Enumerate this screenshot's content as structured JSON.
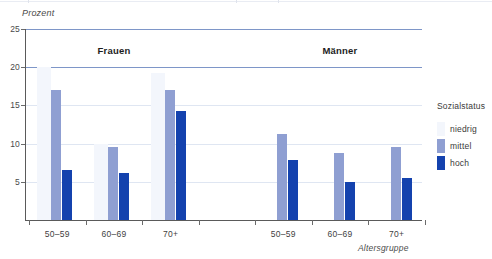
{
  "chart_data": {
    "type": "bar",
    "title": "",
    "subtitle": "",
    "xlabel": "Altersgruppe",
    "ylabel": "Prozent",
    "ylim": [
      0,
      25
    ],
    "yticks": [
      25,
      20,
      15,
      10,
      5
    ],
    "grid": "horizontal",
    "legend_position": "right",
    "legend_title": "Sozialstatus",
    "panels": [
      {
        "label": "Frauen",
        "categories": [
          "50–59",
          "60–69",
          "70+"
        ],
        "series": [
          {
            "name": "niedrig",
            "values": [
              20.0,
              10.0,
              19.2
            ]
          },
          {
            "name": "mittel",
            "values": [
              17.0,
              9.5,
              17.0
            ]
          },
          {
            "name": "hoch",
            "values": [
              6.5,
              6.2,
              14.3
            ]
          }
        ]
      },
      {
        "label": "Männer",
        "categories": [
          "50–59",
          "60–69",
          "70+"
        ],
        "series": [
          {
            "name": "niedrig",
            "values": [
              0.0,
              0.0,
              0.0
            ]
          },
          {
            "name": "mittel",
            "values": [
              11.2,
              8.8,
              9.5
            ]
          },
          {
            "name": "hoch",
            "values": [
              7.8,
              5.0,
              5.5
            ]
          }
        ]
      }
    ],
    "series_colors": {
      "niedrig": "#f3f6fc",
      "mittel": "#8f9fd2",
      "hoch": "#1442ae"
    },
    "axis_color": "#5a5a5a",
    "gridline_strong_color": "#7e96c8",
    "gridline_soft_color": "#dfe6f2"
  },
  "legend": {
    "title": "Sozialstatus",
    "items": [
      {
        "label": "niedrig",
        "color": "#f3f6fc"
      },
      {
        "label": "mittel",
        "color": "#8f9fd2"
      },
      {
        "label": "hoch",
        "color": "#1442ae"
      }
    ]
  },
  "axes": {
    "y_title": "Prozent",
    "x_title": "Altersgruppe",
    "y_tick_labels": [
      "25",
      "20",
      "15",
      "10",
      "5"
    ],
    "x_tick_labels": [
      "50–59",
      "60–69",
      "70+",
      "50–59",
      "60–69",
      "70+"
    ]
  },
  "groups": {
    "left_heading": "Frauen",
    "right_heading": "Männer"
  }
}
